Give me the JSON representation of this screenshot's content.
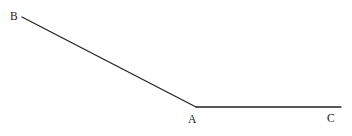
{
  "figure": {
    "kind": "geometry-angle-diagram",
    "width": 352,
    "height": 136,
    "background_color": "#ffffff",
    "stroke_color": "#222222",
    "stroke_width": 1.3,
    "label_color": "#1a1a1a"
  },
  "labels": {
    "b": "B",
    "a": "A",
    "c": "C"
  },
  "points": {
    "B": {
      "x": 22,
      "y": 17
    },
    "A": {
      "x": 196,
      "y": 107
    },
    "C": {
      "x": 341,
      "y": 107
    }
  },
  "segments": [
    {
      "name": "ray-AB",
      "from": "A",
      "to": "B",
      "x1": 22,
      "y1": 17,
      "x2": 196,
      "y2": 107
    },
    {
      "name": "ray-AC",
      "from": "A",
      "to": "C",
      "x1": 196,
      "y1": 107,
      "x2": 341,
      "y2": 107
    }
  ],
  "label_positions": {
    "B": {
      "x": 10,
      "y": 10
    },
    "A": {
      "x": 188,
      "y": 113
    },
    "C": {
      "x": 327,
      "y": 112
    }
  }
}
